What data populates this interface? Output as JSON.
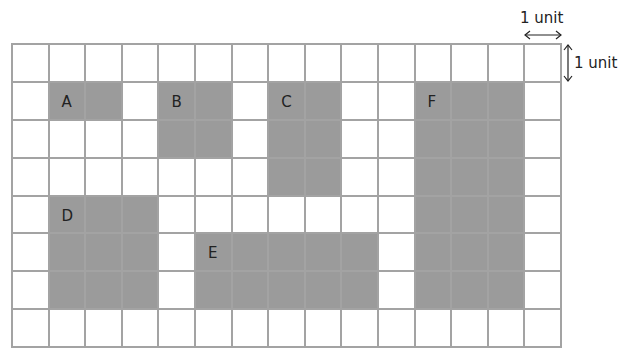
{
  "diagram": {
    "grid": {
      "cols": 15,
      "rows": 8,
      "line_color": "#a3a3a3",
      "fill_color": "#9b9b9b"
    },
    "shapes": [
      {
        "label": "A",
        "col": 1,
        "row": 1,
        "w": 2,
        "h": 1
      },
      {
        "label": "B",
        "col": 4,
        "row": 1,
        "w": 2,
        "h": 2
      },
      {
        "label": "C",
        "col": 7,
        "row": 1,
        "w": 2,
        "h": 3
      },
      {
        "label": "D",
        "col": 1,
        "row": 4,
        "w": 3,
        "h": 3
      },
      {
        "label": "E",
        "col": 5,
        "row": 5,
        "w": 5,
        "h": 2
      },
      {
        "label": "F",
        "col": 11,
        "row": 1,
        "w": 3,
        "h": 6
      }
    ],
    "scale": {
      "horizontal_label": "1 unit",
      "vertical_label": "1 unit"
    }
  }
}
